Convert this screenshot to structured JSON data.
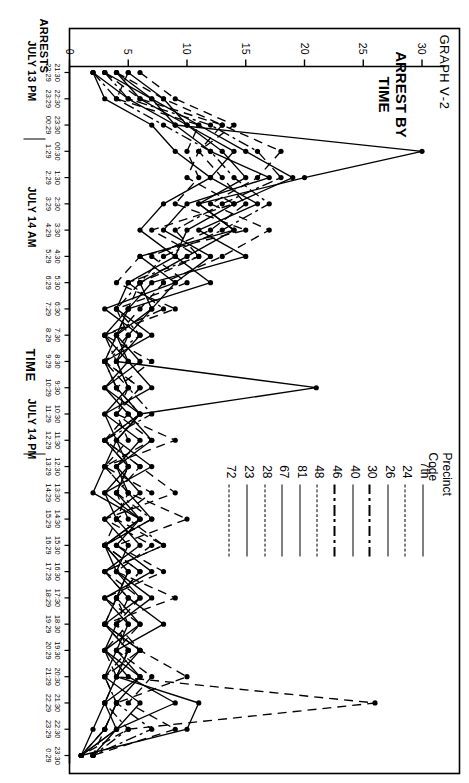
{
  "figure": {
    "graph_number": "GRAPH Ⅴ-2",
    "title_line1": "ARREST BY",
    "title_line2": "TIME",
    "y_axis_title": "ARRESTS",
    "x_axis_title": "TIME",
    "day_labels": [
      "JULY 13 PM",
      "JULY 14 AM",
      "JULY 14 PM"
    ]
  },
  "legend": {
    "title": "Precinct Code",
    "entries": [
      {
        "label": "7th",
        "style": "solid"
      },
      {
        "label": "24",
        "style": "dashed"
      },
      {
        "label": "26",
        "style": "solid"
      },
      {
        "label": "30",
        "style": "dashdot"
      },
      {
        "label": "40",
        "style": "solid"
      },
      {
        "label": "46",
        "style": "dashdot"
      },
      {
        "label": "48",
        "style": "dashed"
      },
      {
        "label": "81",
        "style": "solid"
      },
      {
        "label": "67",
        "style": "solid"
      },
      {
        "label": "28",
        "style": "dashed"
      },
      {
        "label": "23",
        "style": "solid"
      },
      {
        "label": "72",
        "style": "dashed"
      }
    ]
  },
  "chart_data": {
    "type": "line",
    "title": "ARREST BY TIME",
    "xlabel": "TIME",
    "ylabel": "ARRESTS",
    "ylim": [
      0,
      32
    ],
    "yticks": [
      0,
      5,
      10,
      15,
      20,
      25,
      30
    ],
    "grid": false,
    "legend_position": "top-right",
    "categories": [
      "21:30\n22:29",
      "22:30\n23:29",
      "23:30\n00:29",
      "00:30\n1:29",
      "1:30\n2:29",
      "2:30\n3:29",
      "3:30\n4:29",
      "4:30\n5:29",
      "5:30\n6:29",
      "6:30\n7:29",
      "7:30\n8:29",
      "8:30\n9:29",
      "9:30\n10:29",
      "10:30\n11:29",
      "11:30\n12:29",
      "12:30\n13:29",
      "13:30\n14:29",
      "14:30\n15:29",
      "15:30\n16:29",
      "16:30\n17:29",
      "17:30\n18:29",
      "18:30\n19:29",
      "19:30\n20:29",
      "20:30\n21:29",
      "21:30\n22:29",
      "22:30\n23:29",
      "23:30\n0:29"
    ],
    "tick_top": [
      "21:30",
      "22:30",
      "23:30",
      "00:30",
      "1:30",
      "2:30",
      "3:30",
      "4:30",
      "5:30",
      "6:30",
      "7:30",
      "8:30",
      "9:30",
      "10:30",
      "11:30",
      "12:30",
      "13:30",
      "14:30",
      "15:30",
      "16:30",
      "17:30",
      "18:30",
      "19:30",
      "20:30",
      "21:30",
      "22:30",
      "23:30"
    ],
    "tick_bottom": [
      "22:29",
      "23:29",
      "00:29",
      "1:29",
      "2:29",
      "3:29",
      "4:29",
      "5:29",
      "6:29",
      "7:29",
      "8:29",
      "9:29",
      "10:29",
      "11:29",
      "12:29",
      "13:29",
      "14:29",
      "15:29",
      "16:29",
      "17:29",
      "18:29",
      "19:29",
      "20:29",
      "21:29",
      "22:29",
      "23:29",
      "0:29"
    ],
    "series": [
      {
        "name": "7th",
        "style": "solid",
        "values": [
          2,
          5,
          9,
          30,
          20,
          11,
          14,
          6,
          9,
          7,
          5,
          4,
          21,
          6,
          4,
          3,
          2,
          6,
          3,
          5,
          4,
          3,
          6,
          4,
          3,
          2,
          1
        ]
      },
      {
        "name": "24",
        "style": "dashed",
        "values": [
          3,
          6,
          13,
          18,
          16,
          12,
          17,
          13,
          8,
          6,
          4,
          3,
          5,
          4,
          9,
          3,
          5,
          10,
          4,
          8,
          3,
          6,
          4,
          7,
          5,
          9,
          2
        ]
      },
      {
        "name": "26",
        "style": "solid",
        "values": [
          4,
          7,
          11,
          15,
          19,
          14,
          10,
          9,
          12,
          5,
          3,
          5,
          7,
          3,
          4,
          7,
          3,
          4,
          6,
          3,
          5,
          8,
          4,
          3,
          6,
          4,
          1
        ]
      },
      {
        "name": "30",
        "style": "dashdot",
        "values": [
          2,
          4,
          8,
          12,
          14,
          17,
          13,
          8,
          6,
          4,
          6,
          3,
          4,
          6,
          3,
          5,
          4,
          7,
          3,
          6,
          4,
          3,
          5,
          4,
          3,
          5,
          2
        ]
      },
      {
        "name": "40",
        "style": "solid",
        "values": [
          5,
          8,
          10,
          14,
          12,
          16,
          11,
          15,
          7,
          5,
          4,
          6,
          3,
          5,
          7,
          4,
          6,
          3,
          5,
          4,
          7,
          4,
          3,
          6,
          4,
          3,
          1
        ]
      },
      {
        "name": "46",
        "style": "dashdot",
        "values": [
          3,
          5,
          12,
          16,
          18,
          13,
          9,
          11,
          5,
          8,
          3,
          4,
          5,
          7,
          3,
          6,
          4,
          5,
          8,
          3,
          5,
          4,
          6,
          3,
          4,
          7,
          2
        ]
      },
      {
        "name": "48",
        "style": "dashed",
        "values": [
          6,
          9,
          14,
          11,
          13,
          15,
          12,
          7,
          10,
          4,
          5,
          3,
          6,
          4,
          5,
          3,
          7,
          4,
          3,
          6,
          4,
          5,
          3,
          4,
          26,
          5,
          1
        ]
      },
      {
        "name": "81",
        "style": "solid",
        "values": [
          4,
          6,
          10,
          13,
          15,
          11,
          14,
          10,
          6,
          7,
          4,
          5,
          3,
          6,
          4,
          5,
          3,
          6,
          4,
          7,
          3,
          5,
          4,
          6,
          3,
          4,
          2
        ]
      },
      {
        "name": "67",
        "style": "solid",
        "values": [
          3,
          7,
          9,
          12,
          17,
          10,
          8,
          12,
          9,
          3,
          6,
          4,
          5,
          3,
          6,
          4,
          5,
          7,
          3,
          4,
          6,
          3,
          5,
          4,
          11,
          10,
          1
        ]
      },
      {
        "name": "28",
        "style": "dashed",
        "values": [
          5,
          4,
          11,
          10,
          11,
          9,
          15,
          6,
          4,
          9,
          3,
          7,
          4,
          5,
          3,
          6,
          9,
          3,
          7,
          4,
          9,
          3,
          6,
          10,
          4,
          3,
          1
        ]
      },
      {
        "name": "23",
        "style": "solid",
        "values": [
          2,
          3,
          7,
          9,
          12,
          8,
          6,
          9,
          5,
          4,
          7,
          3,
          4,
          6,
          3,
          5,
          4,
          6,
          3,
          5,
          4,
          6,
          3,
          5,
          9,
          4,
          1
        ]
      },
      {
        "name": "72",
        "style": "dashed",
        "values": [
          4,
          8,
          13,
          11,
          10,
          14,
          7,
          11,
          6,
          5,
          4,
          3,
          6,
          4,
          7,
          3,
          5,
          4,
          8,
          3,
          6,
          4,
          5,
          3,
          4,
          3,
          2
        ]
      }
    ]
  }
}
